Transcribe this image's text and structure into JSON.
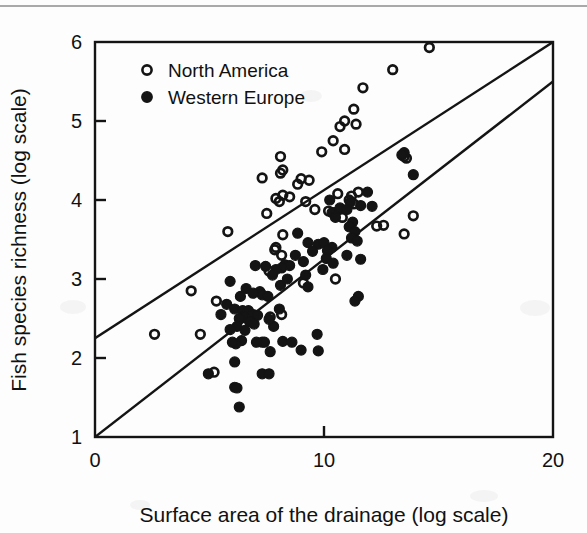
{
  "figure": {
    "background_color": "#fdfdfd",
    "ink_color": "#141414"
  },
  "chart_data": {
    "type": "scatter",
    "title": "",
    "subtitle": "",
    "xlabel": "Surface area of the drainage (log scale)",
    "ylabel": "Fish species richness (log scale)",
    "xlim": [
      0,
      20
    ],
    "ylim": [
      1,
      6
    ],
    "xticks": [
      0,
      10,
      20
    ],
    "xticklabels": [
      "0",
      "10",
      "20"
    ],
    "yticks": [
      1,
      2,
      3,
      4,
      5,
      6
    ],
    "yticklabels": [
      "1",
      "2",
      "3",
      "4",
      "5",
      "6"
    ],
    "grid": false,
    "legend_position": "top-left",
    "frame": "full-box",
    "tick_direction": "in",
    "marker_size": 8,
    "series": [
      {
        "name": "North America",
        "marker": "open-circle",
        "color": "#141414",
        "fill": "none",
        "points": [
          [
            14.6,
            5.93
          ],
          [
            13.0,
            5.65
          ],
          [
            11.7,
            5.42
          ],
          [
            11.3,
            5.15
          ],
          [
            10.9,
            5.0
          ],
          [
            11.4,
            4.96
          ],
          [
            10.7,
            4.93
          ],
          [
            10.4,
            4.75
          ],
          [
            10.9,
            4.64
          ],
          [
            9.9,
            4.61
          ],
          [
            8.1,
            4.55
          ],
          [
            8.2,
            4.38
          ],
          [
            8.1,
            4.34
          ],
          [
            7.3,
            4.28
          ],
          [
            9.0,
            4.27
          ],
          [
            9.35,
            4.25
          ],
          [
            8.85,
            4.2
          ],
          [
            13.5,
            4.55
          ],
          [
            13.6,
            4.53
          ],
          [
            8.2,
            4.06
          ],
          [
            8.5,
            4.04
          ],
          [
            7.9,
            4.02
          ],
          [
            8.05,
            3.98
          ],
          [
            9.2,
            3.98
          ],
          [
            10.6,
            4.08
          ],
          [
            11.2,
            4.05
          ],
          [
            11.1,
            4.0
          ],
          [
            11.3,
            3.95
          ],
          [
            11.5,
            4.1
          ],
          [
            10.45,
            3.84
          ],
          [
            10.8,
            3.78
          ],
          [
            7.5,
            3.83
          ],
          [
            9.6,
            3.88
          ],
          [
            10.2,
            3.86
          ],
          [
            13.9,
            3.8
          ],
          [
            12.6,
            3.68
          ],
          [
            5.8,
            3.6
          ],
          [
            8.2,
            3.56
          ],
          [
            13.5,
            3.57
          ],
          [
            7.9,
            3.4
          ],
          [
            7.85,
            3.37
          ],
          [
            8.15,
            3.3
          ],
          [
            7.6,
            3.1
          ],
          [
            10.5,
            3.0
          ],
          [
            9.1,
            2.95
          ],
          [
            4.2,
            2.85
          ],
          [
            5.3,
            2.72
          ],
          [
            8.15,
            2.55
          ],
          [
            6.65,
            2.51
          ],
          [
            7.3,
            2.2
          ],
          [
            2.6,
            2.3
          ],
          [
            4.6,
            2.3
          ],
          [
            5.2,
            1.82
          ],
          [
            7.65,
            2.52
          ],
          [
            12.3,
            3.67
          ]
        ]
      },
      {
        "name": "Western Europe",
        "marker": "filled-circle",
        "color": "#141414",
        "fill": "#141414",
        "points": [
          [
            13.5,
            4.6
          ],
          [
            13.4,
            4.57
          ],
          [
            13.9,
            4.32
          ],
          [
            11.9,
            4.1
          ],
          [
            11.15,
            3.97
          ],
          [
            11.6,
            3.93
          ],
          [
            12.1,
            3.92
          ],
          [
            10.35,
            3.84
          ],
          [
            10.5,
            3.78
          ],
          [
            11.25,
            3.72
          ],
          [
            11.1,
            3.66
          ],
          [
            11.35,
            3.6
          ],
          [
            11.2,
            3.52
          ],
          [
            11.45,
            3.48
          ],
          [
            8.85,
            3.58
          ],
          [
            9.3,
            3.46
          ],
          [
            9.75,
            3.44
          ],
          [
            10.0,
            3.46
          ],
          [
            10.35,
            3.4
          ],
          [
            10.15,
            3.36
          ],
          [
            11.0,
            3.3
          ],
          [
            11.6,
            3.25
          ],
          [
            9.1,
            3.22
          ],
          [
            8.3,
            3.18
          ],
          [
            8.5,
            3.17
          ],
          [
            8.15,
            3.14
          ],
          [
            10.1,
            3.26
          ],
          [
            10.4,
            3.2
          ],
          [
            9.95,
            3.12
          ],
          [
            7.9,
            3.12
          ],
          [
            7.75,
            3.05
          ],
          [
            5.9,
            2.97
          ],
          [
            8.1,
            2.92
          ],
          [
            6.6,
            2.88
          ],
          [
            7.2,
            2.84
          ],
          [
            7.3,
            2.8
          ],
          [
            9.3,
            2.9
          ],
          [
            11.5,
            2.78
          ],
          [
            11.35,
            2.72
          ],
          [
            6.35,
            2.78
          ],
          [
            5.75,
            2.68
          ],
          [
            6.9,
            2.82
          ],
          [
            7.55,
            2.78
          ],
          [
            6.1,
            2.62
          ],
          [
            6.45,
            2.6
          ],
          [
            6.7,
            2.6
          ],
          [
            6.9,
            2.55
          ],
          [
            7.1,
            2.54
          ],
          [
            6.5,
            2.52
          ],
          [
            6.3,
            2.5
          ],
          [
            6.75,
            2.46
          ],
          [
            6.95,
            2.43
          ],
          [
            6.2,
            2.4
          ],
          [
            7.8,
            2.4
          ],
          [
            5.9,
            2.36
          ],
          [
            6.55,
            2.35
          ],
          [
            9.7,
            2.3
          ],
          [
            8.2,
            2.21
          ],
          [
            8.6,
            2.2
          ],
          [
            7.4,
            2.2
          ],
          [
            7.05,
            2.2
          ],
          [
            6.4,
            2.22
          ],
          [
            6.15,
            2.18
          ],
          [
            9.0,
            2.1
          ],
          [
            9.75,
            2.09
          ],
          [
            7.65,
            2.08
          ],
          [
            6.1,
            1.95
          ],
          [
            7.3,
            1.8
          ],
          [
            7.6,
            1.8
          ],
          [
            4.95,
            1.8
          ],
          [
            6.1,
            1.63
          ],
          [
            6.2,
            1.62
          ],
          [
            6.3,
            1.38
          ],
          [
            10.7,
            3.9
          ],
          [
            11.0,
            3.88
          ],
          [
            10.25,
            4.0
          ],
          [
            9.5,
            3.35
          ],
          [
            8.75,
            3.3
          ],
          [
            9.2,
            3.05
          ],
          [
            8.4,
            3.0
          ],
          [
            5.5,
            2.55
          ],
          [
            7.0,
            3.17
          ],
          [
            7.45,
            3.16
          ],
          [
            8.05,
            2.62
          ],
          [
            7.6,
            2.49
          ],
          [
            6.0,
            2.2
          ]
        ]
      }
    ],
    "trend_lines": [
      {
        "name": "north-america-trend",
        "x0": 0,
        "y0": 2.25,
        "x1": 20,
        "y1": 6.0
      },
      {
        "name": "western-europe-trend",
        "x0": 0,
        "y0": 1.0,
        "x1": 20,
        "y1": 5.5
      }
    ]
  }
}
